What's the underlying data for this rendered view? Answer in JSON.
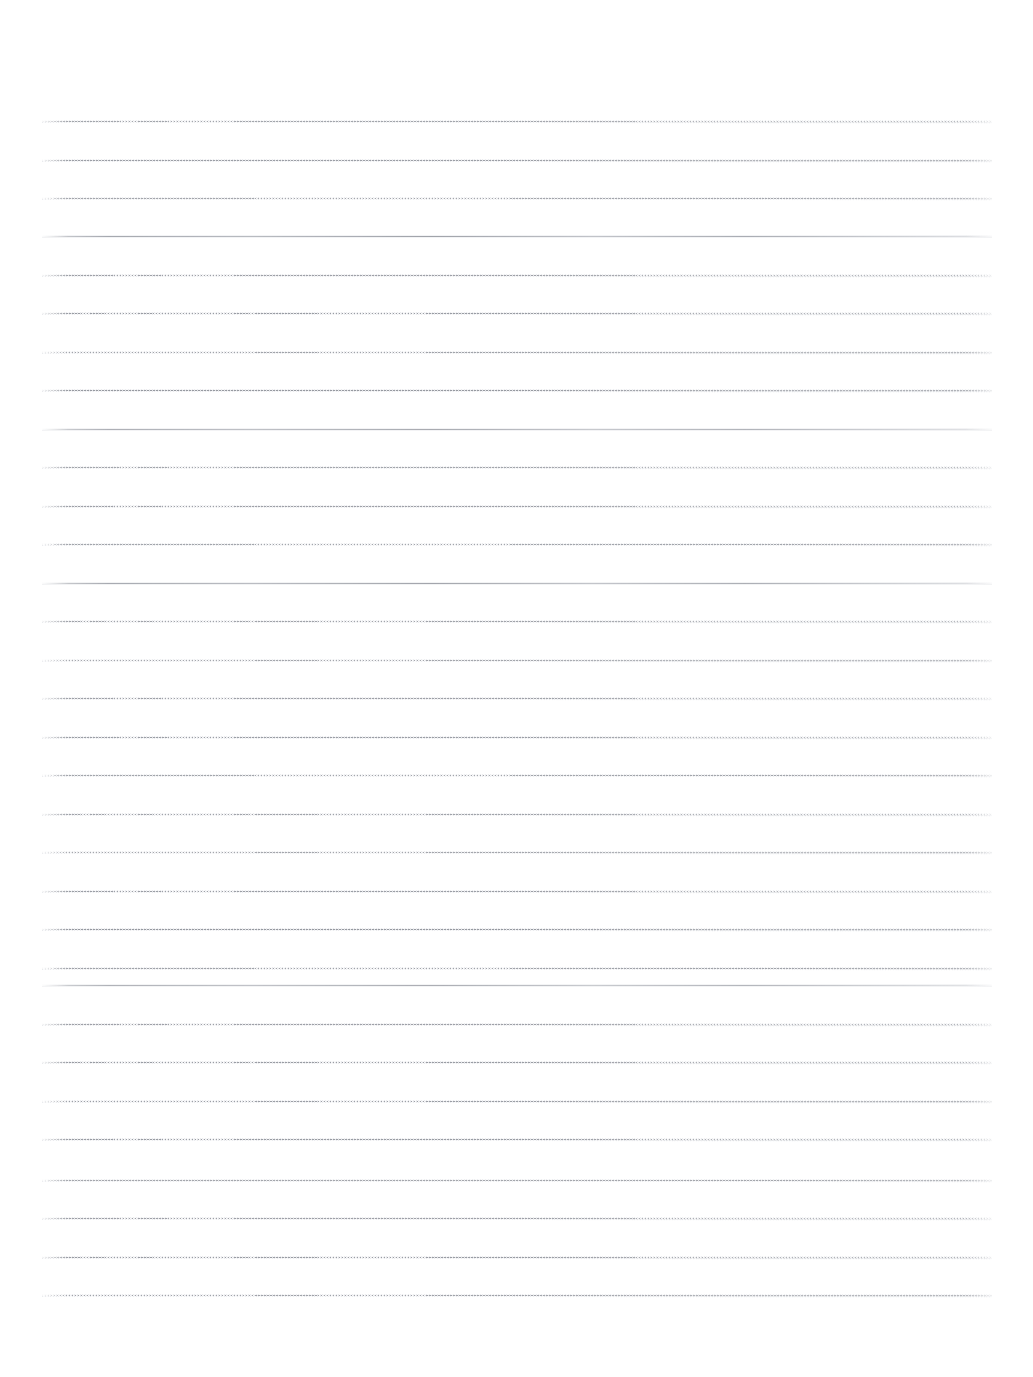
{
  "document": {
    "kind": "scanned-lined-paper",
    "title": "Blank Lined Paper",
    "page_width": 1033,
    "page_height": 1377,
    "background_color": "#ffffff",
    "content": "",
    "handwriting": "",
    "text_blocks": []
  },
  "margins": {
    "top": 121,
    "bottom": 82,
    "left": 42,
    "right": 41
  },
  "ruling": {
    "line_count": 31,
    "first_line_y": 121,
    "last_line_y": 1295,
    "line_spacing": 38.6,
    "line_left_x": 42,
    "line_right_x": 992,
    "line_length": 950,
    "dotted_line_color": "#6c707a",
    "solid_line_color": "#787c86",
    "halo_color": "#c4c7ce",
    "stroke_width": 1,
    "emphasis_every_nth": 5,
    "lines": [
      {
        "index": 1,
        "y": 121,
        "style": "dotted",
        "tilt": 0.22,
        "opacity": 0.8
      },
      {
        "index": 2,
        "y": 160,
        "style": "dotted",
        "tilt": 0.3,
        "opacity": 0.86
      },
      {
        "index": 3,
        "y": 198,
        "style": "dotted",
        "tilt": 0.18,
        "opacity": 0.78
      },
      {
        "index": 4,
        "y": 236,
        "style": "solid",
        "tilt": 0.1,
        "opacity": 0.72
      },
      {
        "index": 5,
        "y": 275,
        "style": "dotted",
        "tilt": 0.24,
        "opacity": 0.84
      },
      {
        "index": 6,
        "y": 313,
        "style": "dotted",
        "tilt": 0.26,
        "opacity": 0.88
      },
      {
        "index": 7,
        "y": 352,
        "style": "dotted",
        "tilt": 0.2,
        "opacity": 0.82
      },
      {
        "index": 8,
        "y": 390,
        "style": "dotted",
        "tilt": 0.28,
        "opacity": 0.9
      },
      {
        "index": 9,
        "y": 429,
        "style": "solid",
        "tilt": 0.08,
        "opacity": 0.66
      },
      {
        "index": 10,
        "y": 467,
        "style": "dotted",
        "tilt": 0.22,
        "opacity": 0.8
      },
      {
        "index": 11,
        "y": 506,
        "style": "dotted",
        "tilt": 0.24,
        "opacity": 0.84
      },
      {
        "index": 12,
        "y": 544,
        "style": "dotted",
        "tilt": 0.18,
        "opacity": 0.8
      },
      {
        "index": 13,
        "y": 583,
        "style": "solid",
        "tilt": 0.12,
        "opacity": 0.7
      },
      {
        "index": 14,
        "y": 621,
        "style": "dotted",
        "tilt": 0.26,
        "opacity": 0.82
      },
      {
        "index": 15,
        "y": 660,
        "style": "dotted",
        "tilt": 0.2,
        "opacity": 0.78
      },
      {
        "index": 16,
        "y": 698,
        "style": "dotted",
        "tilt": 0.24,
        "opacity": 0.84
      },
      {
        "index": 17,
        "y": 737,
        "style": "dotted",
        "tilt": 0.22,
        "opacity": 0.86
      },
      {
        "index": 18,
        "y": 775,
        "style": "dotted",
        "tilt": 0.18,
        "opacity": 0.8
      },
      {
        "index": 19,
        "y": 814,
        "style": "dotted",
        "tilt": 0.26,
        "opacity": 0.82
      },
      {
        "index": 20,
        "y": 852,
        "style": "dotted",
        "tilt": 0.2,
        "opacity": 0.78
      },
      {
        "index": 21,
        "y": 891,
        "style": "dotted",
        "tilt": 0.24,
        "opacity": 0.86
      },
      {
        "index": 22,
        "y": 929,
        "style": "dotted",
        "tilt": 0.28,
        "opacity": 0.9
      },
      {
        "index": 23,
        "y": 968,
        "style": "dotted",
        "tilt": 0.18,
        "opacity": 0.82
      },
      {
        "index": 24,
        "y": 985,
        "style": "solid",
        "tilt": 0.06,
        "opacity": 0.64
      },
      {
        "index": 25,
        "y": 1024,
        "style": "dotted",
        "tilt": 0.22,
        "opacity": 0.84
      },
      {
        "index": 26,
        "y": 1062,
        "style": "dotted",
        "tilt": 0.26,
        "opacity": 0.88
      },
      {
        "index": 27,
        "y": 1101,
        "style": "dotted",
        "tilt": 0.2,
        "opacity": 0.86
      },
      {
        "index": 28,
        "y": 1139,
        "style": "dotted",
        "tilt": 0.24,
        "opacity": 0.88
      },
      {
        "index": 29,
        "y": 1180,
        "style": "dotted",
        "tilt": 0.16,
        "opacity": 0.78
      },
      {
        "index": 30,
        "y": 1218,
        "style": "dotted",
        "tilt": 0.22,
        "opacity": 0.84
      },
      {
        "index": 31,
        "y": 1257,
        "style": "dotted",
        "tilt": 0.26,
        "opacity": 0.88
      },
      {
        "index": 32,
        "y": 1295,
        "style": "dotted",
        "tilt": 0.2,
        "opacity": 0.82
      }
    ]
  }
}
